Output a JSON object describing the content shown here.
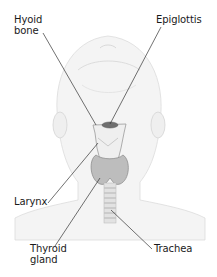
{
  "diagram": {
    "labels": [
      {
        "id": "hyoid",
        "text": "Hyoid\nbone",
        "x": 14,
        "y": 14
      },
      {
        "id": "epiglottis",
        "text": "Epiglottis",
        "x": 156,
        "y": 14
      },
      {
        "id": "larynx",
        "text": "Larynx",
        "x": 14,
        "y": 196
      },
      {
        "id": "thyroid",
        "text": "Thyroid\ngland",
        "x": 30,
        "y": 243
      },
      {
        "id": "trachea",
        "text": "Trachea",
        "x": 154,
        "y": 243
      }
    ],
    "leaders": [
      {
        "id": "hyoid",
        "x1": 43,
        "y1": 33,
        "x2": 96,
        "y2": 125
      },
      {
        "id": "epiglottis",
        "x1": 161,
        "y1": 27,
        "x2": 110,
        "y2": 124
      },
      {
        "id": "larynx",
        "x1": 48,
        "y1": 203,
        "x2": 98,
        "y2": 143
      },
      {
        "id": "thyroid",
        "x1": 55,
        "y1": 246,
        "x2": 100,
        "y2": 178
      },
      {
        "id": "trachea",
        "x1": 152,
        "y1": 249,
        "x2": 111,
        "y2": 210
      }
    ],
    "colors": {
      "text": "#1a1a1a",
      "leader": "#333333",
      "head_outline": "#d9d9d9",
      "head_fill": "#f3f3f3",
      "cartilage": "#efefef",
      "thyroid": "#bdbdbd",
      "trachea_ring": "#c9c9c9"
    }
  }
}
